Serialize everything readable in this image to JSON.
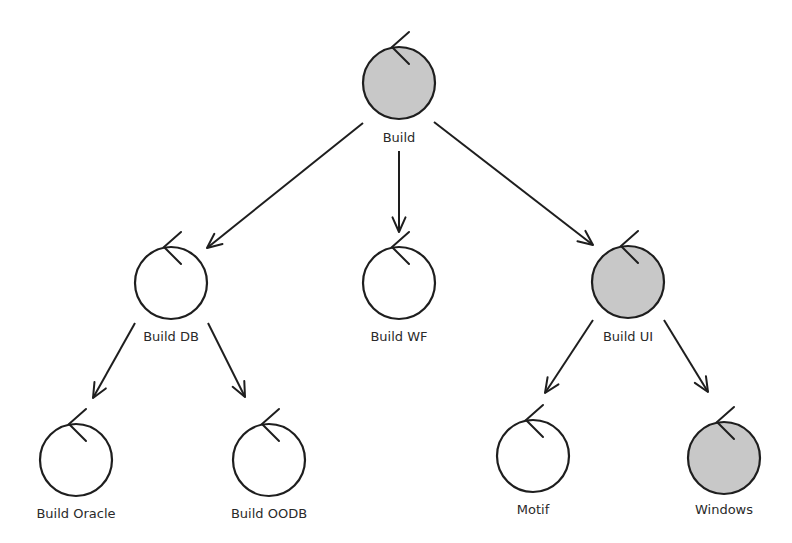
{
  "diagram": {
    "type": "tree",
    "colors": {
      "stroke": "#1e1e1e",
      "filled": "#c8c8c8",
      "empty": "#ffffff",
      "label": "#2a2a2a"
    },
    "node_radius": 36,
    "nodes": [
      {
        "id": "build",
        "label": "Build",
        "cx": 399,
        "cy": 83,
        "filled": true,
        "label_y": 142
      },
      {
        "id": "build-db",
        "label": "Build DB",
        "cx": 171,
        "cy": 283,
        "filled": false,
        "label_y": 341
      },
      {
        "id": "build-wf",
        "label": "Build WF",
        "cx": 399,
        "cy": 283,
        "filled": false,
        "label_y": 341
      },
      {
        "id": "build-ui",
        "label": "Build UI",
        "cx": 628,
        "cy": 282,
        "filled": true,
        "label_y": 341
      },
      {
        "id": "build-oracle",
        "label": "Build Oracle",
        "cx": 76,
        "cy": 460,
        "filled": false,
        "label_y": 518
      },
      {
        "id": "build-oodb",
        "label": "Build OODB",
        "cx": 269,
        "cy": 460,
        "filled": false,
        "label_y": 518
      },
      {
        "id": "motif",
        "label": "Motif",
        "cx": 533,
        "cy": 456,
        "filled": false,
        "label_y": 514
      },
      {
        "id": "windows",
        "label": "Windows",
        "cx": 724,
        "cy": 458,
        "filled": true,
        "label_y": 514
      }
    ],
    "edges": [
      {
        "from": "build",
        "to": "build-db",
        "x1": 363,
        "y1": 123,
        "x2": 207,
        "y2": 248
      },
      {
        "from": "build",
        "to": "build-wf",
        "x1": 399,
        "y1": 151,
        "x2": 399,
        "y2": 232
      },
      {
        "from": "build",
        "to": "build-ui",
        "x1": 434,
        "y1": 122,
        "x2": 593,
        "y2": 245
      },
      {
        "from": "build-db",
        "to": "build-oracle",
        "x1": 135,
        "y1": 323,
        "x2": 93,
        "y2": 398
      },
      {
        "from": "build-db",
        "to": "build-oodb",
        "x1": 208,
        "y1": 323,
        "x2": 245,
        "y2": 397
      },
      {
        "from": "build-ui",
        "to": "motif",
        "x1": 593,
        "y1": 320,
        "x2": 545,
        "y2": 393
      },
      {
        "from": "build-ui",
        "to": "windows",
        "x1": 664,
        "y1": 320,
        "x2": 708,
        "y2": 392
      }
    ]
  }
}
